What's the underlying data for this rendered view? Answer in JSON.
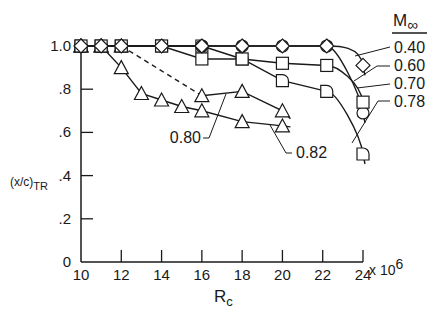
{
  "chart_data": {
    "type": "line",
    "title": "",
    "xlabel": "R",
    "xlabel_sub": "c",
    "xscale_suffix": "x 10",
    "xscale_exp": "6",
    "ylabel": "(x/c)",
    "ylabel_sub": "TR",
    "xlim": [
      10,
      24
    ],
    "ylim": [
      0,
      1.0
    ],
    "xticks": [
      10,
      12,
      14,
      16,
      18,
      20,
      22,
      24
    ],
    "xtick_labels": [
      "10",
      "12",
      "14",
      "16",
      "18",
      "20",
      "22",
      "24"
    ],
    "yticks": [
      0,
      0.2,
      0.4,
      0.6,
      0.8,
      1.0
    ],
    "ytick_labels": [
      "0",
      ".2",
      ".4",
      ".6",
      ".8",
      "1.0"
    ],
    "grid": false,
    "legend_title": "M",
    "legend_title_sub": "∞",
    "legend_position": "right",
    "series": [
      {
        "name": "0.40",
        "marker": "diamond",
        "x": [
          10,
          11,
          12,
          14,
          16,
          18,
          20,
          22.2,
          24
        ],
        "y": [
          1.0,
          1.0,
          1.0,
          1.0,
          1.0,
          1.0,
          1.0,
          1.0,
          0.91
        ]
      },
      {
        "name": "0.60",
        "marker": "square",
        "x": [
          10,
          11,
          12,
          14,
          16,
          18,
          20,
          22.2,
          24
        ],
        "y": [
          1.0,
          1.0,
          1.0,
          1.0,
          0.94,
          0.94,
          0.92,
          0.91,
          0.74
        ]
      },
      {
        "name": "0.70",
        "marker": "circle",
        "x": [
          10,
          11,
          12,
          14,
          16,
          18,
          20,
          22.2,
          24
        ],
        "y": [
          1.0,
          1.0,
          1.0,
          1.0,
          1.0,
          1.0,
          1.0,
          1.0,
          0.69
        ]
      },
      {
        "name": "0.78",
        "marker": "half-circle",
        "x": [
          10,
          11,
          12,
          14,
          16,
          18,
          20,
          22.2,
          24
        ],
        "y": [
          1.0,
          1.0,
          1.0,
          1.0,
          1.0,
          0.94,
          0.84,
          0.79,
          0.5
        ]
      },
      {
        "name": "0.80",
        "marker": "triangle",
        "dashed_segment": [
          12,
          16
        ],
        "x": [
          10,
          11,
          12,
          16,
          18,
          20
        ],
        "y": [
          1.0,
          1.0,
          1.0,
          0.77,
          0.79,
          0.7
        ]
      },
      {
        "name": "0.82",
        "marker": "triangle",
        "x": [
          10,
          11,
          12,
          13,
          14,
          15,
          16,
          18,
          20
        ],
        "y": [
          1.0,
          1.0,
          0.9,
          0.78,
          0.75,
          0.72,
          0.7,
          0.65,
          0.63
        ]
      }
    ]
  }
}
